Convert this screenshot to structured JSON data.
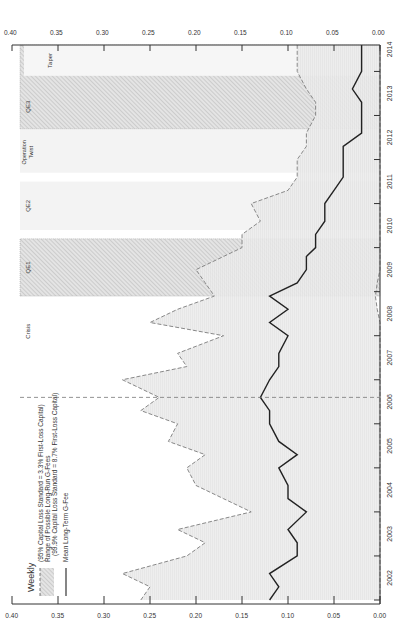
{
  "chart_data": {
    "type": "area",
    "title": "",
    "frequency_label": "Weekly",
    "orientation": "rotated-90-ccw",
    "xlabel": "",
    "ylabel": "",
    "x_ticks": [
      "2002",
      "2003",
      "2004",
      "2005",
      "2006",
      "2007",
      "2008",
      "2009",
      "2010",
      "2011",
      "2012",
      "2013",
      "2014"
    ],
    "y_ticks": [
      "0.00",
      "0.05",
      "0.10",
      "0.15",
      "0.20",
      "0.25",
      "0.30",
      "0.35",
      "0.40"
    ],
    "ylim": [
      0,
      0.4
    ],
    "xlim": [
      2002.0,
      2014.6
    ],
    "legend": [
      {
        "label": "(95% Capital Loss Standard = 3.3% First-Loss Capital)",
        "style": "dashed-bound"
      },
      {
        "label": "Range of Possible Long-Run G-Fees",
        "style": "hatched-fill"
      },
      {
        "label": "(99.9% Capital Loss Standard = 8.7% First-Loss Capital)",
        "style": "dashed-bound"
      },
      {
        "label": "Mean Long-Term G-Fee",
        "style": "solid-line"
      }
    ],
    "annotations": [
      {
        "label": "Crisis",
        "type": "vline",
        "x": 2006.6
      },
      {
        "label": "QE1",
        "type": "band",
        "x_start": 2008.9,
        "x_end": 2010.2
      },
      {
        "label": "QE2",
        "type": "band",
        "x_start": 2010.4,
        "x_end": 2011.5
      },
      {
        "label": "Operation Twist",
        "type": "band",
        "x_start": 2011.7,
        "x_end": 2012.9
      },
      {
        "label": "QE3",
        "type": "band",
        "x_start": 2012.7,
        "x_end": 2014.6
      },
      {
        "label": "Taper",
        "type": "band",
        "x_start": 2013.9,
        "x_end": 2014.6
      }
    ],
    "x": [
      2002.0,
      2002.3,
      2002.6,
      2003.0,
      2003.3,
      2003.6,
      2004.0,
      2004.3,
      2004.6,
      2005.0,
      2005.3,
      2005.6,
      2006.0,
      2006.3,
      2006.6,
      2007.0,
      2007.3,
      2007.6,
      2008.0,
      2008.3,
      2008.6,
      2008.9,
      2009.2,
      2009.5,
      2009.8,
      2010.0,
      2010.3,
      2010.6,
      2011.0,
      2011.3,
      2011.6,
      2012.0,
      2012.3,
      2012.6,
      2013.0,
      2013.3,
      2013.6,
      2014.0,
      2014.3,
      2014.6
    ],
    "series": [
      {
        "name": "Upper bound (99.9% standard)",
        "values": [
          0.26,
          0.25,
          0.28,
          0.21,
          0.19,
          0.22,
          0.14,
          0.17,
          0.2,
          0.21,
          0.19,
          0.23,
          0.22,
          0.26,
          0.24,
          0.28,
          0.21,
          0.22,
          0.17,
          0.25,
          0.22,
          0.18,
          0.19,
          0.2,
          0.17,
          0.15,
          0.15,
          0.13,
          0.14,
          0.1,
          0.09,
          0.09,
          0.08,
          0.08,
          0.07,
          0.07,
          0.08,
          0.09,
          0.09,
          0.09
        ]
      },
      {
        "name": "Mean Long-Term G-Fee",
        "values": [
          0.12,
          0.11,
          0.12,
          0.09,
          0.09,
          0.1,
          0.08,
          0.1,
          0.1,
          0.11,
          0.09,
          0.11,
          0.12,
          0.12,
          0.13,
          0.12,
          0.11,
          0.11,
          0.1,
          0.12,
          0.1,
          0.12,
          0.09,
          0.08,
          0.08,
          0.07,
          0.07,
          0.06,
          0.06,
          0.05,
          0.04,
          0.04,
          0.04,
          0.02,
          0.02,
          0.02,
          0.03,
          0.02,
          0.02,
          0.02
        ]
      },
      {
        "name": "Lower bound (95% standard)",
        "values": [
          0.0,
          0.0,
          0.0,
          0.0,
          0.0,
          0.0,
          0.0,
          0.0,
          0.0,
          0.0,
          0.0,
          0.0,
          0.0,
          0.0,
          0.0,
          0.0,
          0.0,
          0.0,
          0.0,
          0.0,
          0.003,
          0.005,
          0.003,
          0.0,
          0.0,
          0.0,
          0.0,
          0.0,
          0.0,
          0.0,
          0.0,
          0.0,
          0.0,
          0.0,
          0.0,
          0.0,
          0.0,
          0.0,
          0.0,
          0.0
        ]
      }
    ]
  }
}
